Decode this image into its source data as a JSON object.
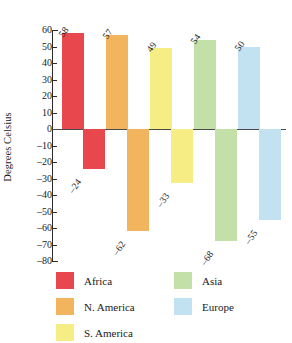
{
  "chart_data": {
    "type": "bar",
    "title": "",
    "xlabel": "",
    "ylabel": "Degrees Celsius",
    "ylim": [
      -80,
      60
    ],
    "ytick_step": 10,
    "yticks": [
      60,
      50,
      40,
      30,
      20,
      10,
      0,
      -10,
      -20,
      -30,
      -40,
      -50,
      -60,
      -70,
      -80
    ],
    "ytick_labels": [
      "60",
      "50",
      "40",
      "30",
      "20",
      "10",
      "0",
      "–10",
      "–20",
      "–30",
      "–40",
      "–50",
      "–60",
      "–70",
      "–80"
    ],
    "grid": false,
    "legend_position": "bottom",
    "categories": [
      "Africa",
      "N. America",
      "S. America",
      "Asia",
      "Europe"
    ],
    "series": [
      {
        "name": "Record high",
        "values": [
          58,
          57,
          49,
          54,
          50
        ],
        "labels": [
          "58",
          "57",
          "49",
          "54",
          "50"
        ]
      },
      {
        "name": "Record low",
        "values": [
          -24,
          -62,
          -33,
          -68,
          -55
        ],
        "labels": [
          "–24",
          "–62",
          "–33",
          "–68",
          "–55"
        ]
      }
    ],
    "colors": {
      "Africa": "#E8484D",
      "N. America": "#F2B45C",
      "S. America": "#F7ED85",
      "Asia": "#C3E0A8",
      "Europe": "#C2E2F2"
    },
    "axis_color": "#2b2b2b",
    "zero_line_color": "#4a4a4a"
  },
  "legend": {
    "entries": [
      {
        "label": "Africa",
        "color": "#E8484D"
      },
      {
        "label": "N. America",
        "color": "#F2B45C"
      },
      {
        "label": "S. America",
        "color": "#F7ED85"
      },
      {
        "label": "Asia",
        "color": "#C3E0A8"
      },
      {
        "label": "Europe",
        "color": "#C2E2F2"
      }
    ]
  }
}
